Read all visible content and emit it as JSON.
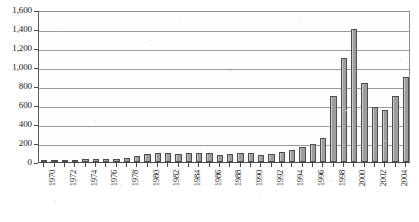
{
  "chart_data": {
    "type": "bar",
    "title": "",
    "subtitle": "",
    "xlabel": "",
    "ylabel": "",
    "ylim": [
      0,
      1600
    ],
    "ytick_step": 200,
    "grid": true,
    "legend": null,
    "legend_position": "none",
    "xtick_label_interval": 2,
    "xtick_label_rotation": -90,
    "bar_fill_color": "#b4b4b4",
    "bar_edge_color": "#4d4d4d",
    "grid_color": "#9a9a9a",
    "axis_color": "#4a4a4a",
    "y_tick_labels": [
      "1,600",
      "1,400",
      "1,200",
      "1,000",
      "800",
      "600",
      "400",
      "200",
      "0"
    ],
    "y_tick_values": [
      1600,
      1400,
      1200,
      1000,
      800,
      600,
      400,
      200,
      0
    ],
    "categories": [
      "1970",
      "1971",
      "1972",
      "1973",
      "1974",
      "1975",
      "1976",
      "1977",
      "1978",
      "1979",
      "1980",
      "1981",
      "1982",
      "1983",
      "1984",
      "1985",
      "1986",
      "1987",
      "1988",
      "1989",
      "1990",
      "1991",
      "1992",
      "1993",
      "1994",
      "1995",
      "1996",
      "1997",
      "1998",
      "1999",
      "2000",
      "2001",
      "2002",
      "2003",
      "2004",
      "2005"
    ],
    "x_tick_labels_shown": [
      "1970",
      "1972",
      "1974",
      "1976",
      "1978",
      "1980",
      "1982",
      "1984",
      "1986",
      "1988",
      "1990",
      "1992",
      "1994",
      "1996",
      "1998",
      "2000",
      "2002",
      "2004"
    ],
    "values": [
      10,
      15,
      18,
      20,
      30,
      35,
      32,
      34,
      45,
      60,
      85,
      100,
      92,
      80,
      95,
      95,
      100,
      75,
      85,
      95,
      100,
      70,
      80,
      110,
      130,
      160,
      190,
      250,
      700,
      1100,
      1400,
      830,
      580,
      550,
      700,
      900
    ]
  }
}
